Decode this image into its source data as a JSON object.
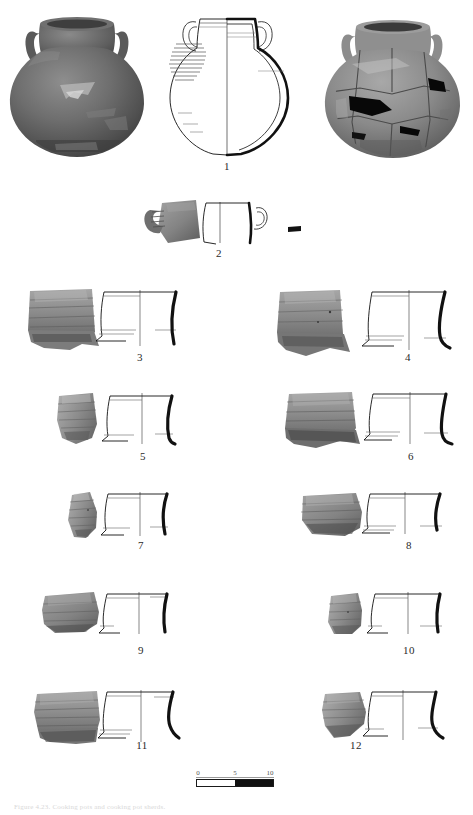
{
  "figure": {
    "title_caption": "Figure 4.23. Cooking pots and cooking pot sherds.",
    "scale": {
      "unit_ticks": [
        "0",
        "5",
        "10"
      ],
      "bar_segments": [
        "light",
        "dark"
      ]
    }
  },
  "items": [
    {
      "number": "1",
      "label_x": 227,
      "label_y": 162,
      "kind": "complete-vessel",
      "views": [
        "photograph-intact",
        "profile-drawing",
        "photograph-reconstructed"
      ]
    },
    {
      "number": "2",
      "label_x": 219,
      "label_y": 249,
      "kind": "handle-sherd",
      "views": [
        "photograph",
        "profile-drawing",
        "section-detail"
      ]
    },
    {
      "number": "3",
      "label_x": 125,
      "label_y": 353,
      "kind": "rim-body-sherd",
      "views": [
        "photograph",
        "profile-drawing"
      ]
    },
    {
      "number": "4",
      "label_x": 393,
      "label_y": 353,
      "kind": "rim-body-sherd",
      "views": [
        "photograph",
        "profile-drawing"
      ]
    },
    {
      "number": "5",
      "label_x": 128,
      "label_y": 452,
      "kind": "rim-sherd",
      "views": [
        "photograph",
        "profile-drawing"
      ]
    },
    {
      "number": "6",
      "label_x": 396,
      "label_y": 452,
      "kind": "rim-body-sherd",
      "views": [
        "photograph",
        "profile-drawing"
      ]
    },
    {
      "number": "7",
      "label_x": 126,
      "label_y": 540,
      "kind": "rim-sherd",
      "views": [
        "photograph",
        "profile-drawing"
      ]
    },
    {
      "number": "8",
      "label_x": 394,
      "label_y": 540,
      "kind": "rim-sherd",
      "views": [
        "photograph",
        "profile-drawing"
      ]
    },
    {
      "number": "9",
      "label_x": 126,
      "label_y": 645,
      "kind": "rim-sherd",
      "views": [
        "photograph",
        "profile-drawing"
      ]
    },
    {
      "number": "10",
      "label_x": 396,
      "label_y": 645,
      "kind": "rim-sherd",
      "views": [
        "photograph",
        "profile-drawing"
      ]
    },
    {
      "number": "11",
      "label_x": 127,
      "label_y": 740,
      "kind": "rim-body-sherd",
      "views": [
        "photograph",
        "profile-drawing"
      ]
    },
    {
      "number": "12",
      "label_x": 341,
      "label_y": 740,
      "kind": "rim-sherd",
      "views": [
        "photograph",
        "profile-drawing"
      ]
    }
  ],
  "colors": {
    "ink": "#111111",
    "paper": "#ffffff",
    "sherd_mid": "#8c8c8c",
    "sherd_dark": "#5d5d5d",
    "sherd_light": "#b4b4b4",
    "section_fill": "#0d0d0d"
  },
  "scale_ticks": [
    {
      "text": "0",
      "x": 193
    },
    {
      "text": "5",
      "x": 227
    },
    {
      "text": "10",
      "x": 262
    }
  ]
}
